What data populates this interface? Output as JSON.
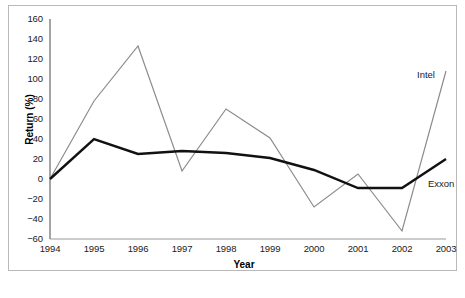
{
  "chart_data": {
    "type": "line",
    "title": "",
    "xlabel": "Year",
    "ylabel": "Return (%)",
    "categories": [
      "1994",
      "1995",
      "1996",
      "1997",
      "1998",
      "1999",
      "2000",
      "2001",
      "2002",
      "2003"
    ],
    "xlim": [
      1994,
      2003
    ],
    "ylim": [
      -60,
      160
    ],
    "yticks": [
      160,
      140,
      120,
      100,
      80,
      60,
      40,
      20,
      0,
      -20,
      -40,
      -60
    ],
    "ytick_labels": [
      "160",
      "140",
      "120",
      "100",
      "80",
      "60",
      "40",
      "20",
      "0",
      "−20",
      "−40",
      "−60"
    ],
    "grid": false,
    "legend_position": "inline-right",
    "series": [
      {
        "name": "Intel",
        "color": "#8c8c8c",
        "width": 1.2,
        "values": [
          0,
          78,
          133,
          8,
          70,
          41,
          -28,
          5,
          -52,
          108
        ]
      },
      {
        "name": "Exxon",
        "color": "#111111",
        "width": 2.4,
        "values": [
          0,
          40,
          25,
          28,
          26,
          21,
          9,
          -9,
          -9,
          20
        ]
      }
    ],
    "annotations": [
      {
        "text": "Intel",
        "series": "Intel"
      },
      {
        "text": "Exxon",
        "series": "Exxon"
      }
    ]
  },
  "frame": {
    "border_color": "#b9b9b9"
  },
  "axes": {
    "axis_color": "#5a5a5a"
  }
}
